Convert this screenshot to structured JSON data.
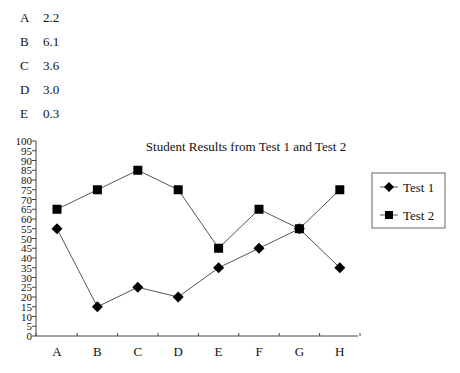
{
  "list": {
    "items": [
      {
        "letter": "A",
        "value": "2.2"
      },
      {
        "letter": "B",
        "value": "6.1"
      },
      {
        "letter": "C",
        "value": "3.6"
      },
      {
        "letter": "D",
        "value": "3.0"
      },
      {
        "letter": "E",
        "value": "0.3"
      }
    ]
  },
  "chart_data": {
    "type": "line",
    "title": "Student Results from Test 1 and Test 2",
    "xlabel": "",
    "ylabel": "",
    "categories": [
      "A",
      "B",
      "C",
      "D",
      "E",
      "F",
      "G",
      "H"
    ],
    "series": [
      {
        "name": "Test 1",
        "marker": "diamond",
        "values": [
          55,
          15,
          25,
          20,
          35,
          45,
          55,
          35
        ]
      },
      {
        "name": "Test 2",
        "marker": "square",
        "values": [
          65,
          75,
          85,
          75,
          45,
          65,
          55,
          75
        ]
      }
    ],
    "ylim": [
      0,
      100
    ],
    "ytick_step": 5,
    "yticks": [
      "0",
      "5",
      "10",
      "15",
      "20",
      "25",
      "30",
      "35",
      "40",
      "45",
      "50",
      "55",
      "60",
      "65",
      "70",
      "75",
      "80",
      "85",
      "90",
      "95",
      "100"
    ],
    "grid": false,
    "legend_position": "right",
    "colors": {
      "line": "#555555",
      "marker": "#000000",
      "axis": "#444444",
      "legend_border": "#666666"
    }
  }
}
